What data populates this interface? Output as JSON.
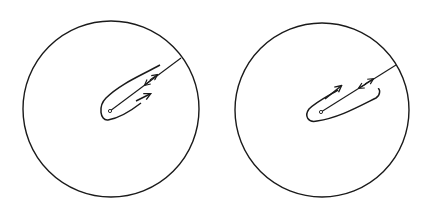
{
  "figure": {
    "stroke_color": "#1a1a1a",
    "background": "#ffffff",
    "panels": [
      {
        "id": "left",
        "circle": {
          "cx": 111,
          "cy": 109,
          "r": 88
        },
        "branch_point": {
          "x": 110,
          "y": 111
        },
        "cut_end": {
          "x": 181,
          "y": 58
        },
        "contour_direction": "outer-lower arrow points outward, arrows on cut point both ways",
        "arrows": [
          "lower-side arrow toward boundary",
          "double arrow on cut"
        ]
      },
      {
        "id": "right",
        "circle": {
          "cx": 322,
          "cy": 110,
          "r": 87
        },
        "branch_point": {
          "x": 321,
          "y": 112
        },
        "cut_end": {
          "x": 396,
          "y": 65
        },
        "contour_direction": "upper-side arrow points toward boundary, arrows on cut point both ways",
        "arrows": [
          "upper-side arrow toward boundary",
          "double arrow on cut"
        ]
      }
    ]
  }
}
